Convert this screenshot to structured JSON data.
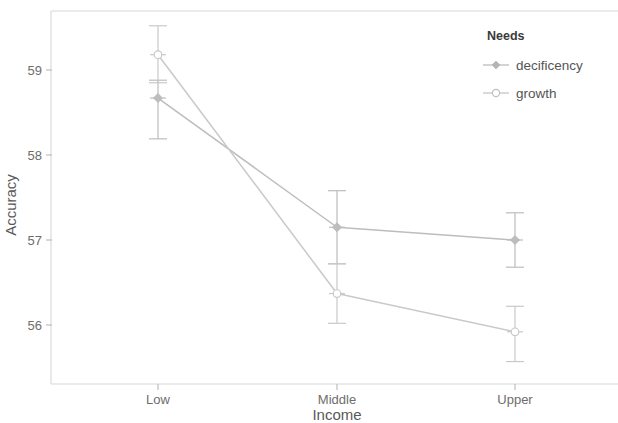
{
  "chart_data": {
    "type": "line",
    "title": "",
    "subtitle": "",
    "xlabel": "Income",
    "ylabel": "Accuracy",
    "categories": [
      "Low",
      "Middle",
      "Upper"
    ],
    "xtick_labels": [
      "Low",
      "Middle",
      "Upper"
    ],
    "ytick_labels": [
      "59",
      "58",
      "57",
      "56"
    ],
    "ytick_values": [
      59,
      58,
      57,
      56
    ],
    "ylim": [
      55.45,
      59.55
    ],
    "grid": false,
    "legend_position": "top-right",
    "legend_title": "Needs",
    "series": [
      {
        "name": "decificency",
        "marker": "diamond-solid",
        "color": "#bdbdbd",
        "values": [
          58.67,
          57.15,
          57.0
        ],
        "error_low": [
          58.19,
          56.72,
          56.68
        ],
        "error_high": [
          58.88,
          57.58,
          57.32
        ]
      },
      {
        "name": "growth",
        "marker": "circle-open",
        "color": "#c9c9c9",
        "values": [
          59.18,
          56.37,
          55.92
        ],
        "error_low": [
          58.85,
          56.02,
          55.57
        ],
        "error_high": [
          59.52,
          56.72,
          56.22
        ]
      }
    ]
  },
  "legend": {
    "title": "Needs",
    "entries": [
      {
        "label": "decificency",
        "marker": "diamond-solid",
        "color": "#bdbdbd"
      },
      {
        "label": "growth",
        "marker": "circle-open",
        "color": "#c9c9c9"
      }
    ]
  },
  "axes": {
    "y_title": "Accuracy",
    "x_title": "Income",
    "y_ticks": [
      "59",
      "58",
      "57",
      "56"
    ],
    "x_ticks": [
      "Low",
      "Middle",
      "Upper"
    ]
  },
  "colors": {
    "frame": "#d8d8d8",
    "tick_text": "#6d6d6d",
    "axis_title": "#595959",
    "series_a": "#bdbdbd",
    "series_b": "#c9c9c9",
    "background": "#ffffff"
  }
}
